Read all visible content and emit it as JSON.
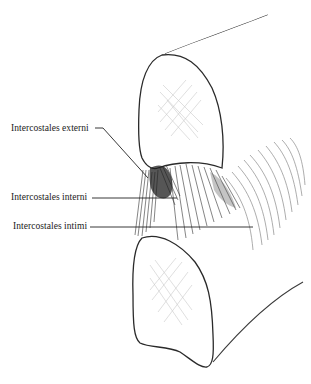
{
  "figure": {
    "labels": [
      {
        "id": "externi",
        "text": "Intercostales externi"
      },
      {
        "id": "interni",
        "text": "Intercostales interni"
      },
      {
        "id": "intimi",
        "text": "Intercostales intimi"
      }
    ],
    "structures": [
      "upper-rib",
      "lower-rib",
      "external-intercostal-fibers",
      "internal-intercostal-fibers",
      "innermost-intercostal-fibers"
    ],
    "colors": {
      "line": "#2a2a2a",
      "hatch": "#c9c9c9",
      "background": "#ffffff"
    }
  }
}
